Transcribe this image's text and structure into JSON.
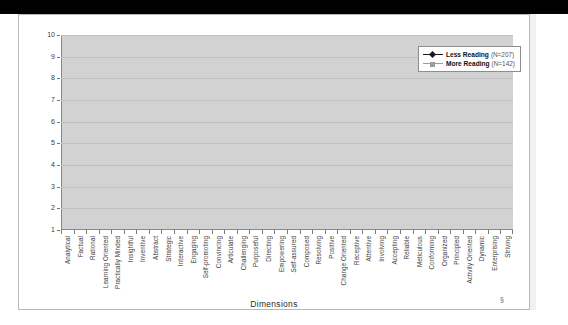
{
  "chart_data": {
    "type": "line",
    "title": "",
    "xlabel": "Dimensions",
    "ylabel": "",
    "ylim": [
      1,
      10
    ],
    "yticks": [
      1,
      2,
      3,
      4,
      5,
      6,
      7,
      8,
      9,
      10
    ],
    "grid": true,
    "legend_position": "top-right",
    "categories": [
      "Analytical",
      "Factual",
      "Rational",
      "Learning Oriented",
      "Practically Minded",
      "Insightful",
      "Inventive",
      "Abstract",
      "Strategic",
      "Interactive",
      "Engaging",
      "Self-promoting",
      "Convincing",
      "Articulate",
      "Challenging",
      "Purposeful",
      "Directing",
      "Empowering",
      "Self-assured",
      "Composed",
      "Resolving",
      "Positive",
      "Change Oriented",
      "Receptive",
      "Attentive",
      "Involving",
      "Accepting",
      "Reliable",
      "Meticulous",
      "Conforming",
      "Organized",
      "Principled",
      "Activity Oriented",
      "Dynamic",
      "Enterprising",
      "Striving"
    ],
    "series": [
      {
        "name": "Less Reading",
        "label": "Less Reading",
        "n_label": "(N=207)",
        "n": 207,
        "color": "#1a1a1a",
        "marker": "diamond",
        "values": [
          5.5,
          5.28,
          5.8,
          5.1,
          5.6,
          5.6,
          5.6,
          5.48,
          5.65,
          5.55,
          5.5,
          5.78,
          5.6,
          5.45,
          5.58,
          5.55,
          5.72,
          5.58,
          5.66,
          5.55,
          5.42,
          5.48,
          5.38,
          5.55,
          5.2,
          5.24,
          5.3,
          5.48,
          5.58,
          5.55,
          5.4,
          5.2,
          5.4,
          5.62,
          5.72,
          5.66
        ]
      },
      {
        "name": "More Reading",
        "label": "More Reading",
        "n_label": "(N=142)",
        "n": 142,
        "color": "#9d9d9d",
        "marker": "square",
        "values": [
          5.52,
          5.97,
          5.22,
          6.28,
          5.36,
          5.5,
          5.55,
          5.6,
          5.4,
          5.42,
          5.47,
          5.22,
          5.4,
          5.6,
          5.56,
          5.48,
          5.22,
          5.42,
          5.26,
          5.42,
          5.48,
          5.47,
          5.72,
          5.5,
          5.9,
          5.72,
          5.62,
          5.46,
          5.38,
          5.22,
          5.52,
          5.72,
          5.5,
          5.22,
          5.08,
          5.25
        ]
      }
    ]
  },
  "axis_title": "Dimensions",
  "stray_mark": "§"
}
